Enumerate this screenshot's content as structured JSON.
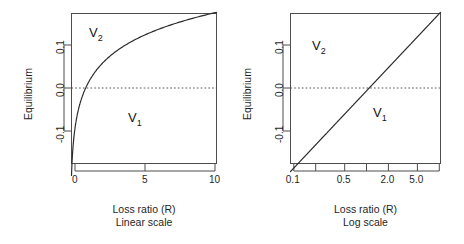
{
  "figure": {
    "background": "#ffffff",
    "line_color": "#2b2b2b",
    "axis_color": "#4d4d4d",
    "zero_line_color": "#555555"
  },
  "panels": [
    {
      "id": "linear",
      "xlabel_line1": "Loss ratio (R)",
      "xlabel_line2": "Linear scale",
      "ylabel": "Equilibrium",
      "region_upper_label": "V",
      "region_upper_sub": "2",
      "region_lower_label": "V",
      "region_lower_sub": "1"
    },
    {
      "id": "log",
      "xlabel_line1": "Loss ratio (R)",
      "xlabel_line2": "Log scale",
      "ylabel": "Equilibrium",
      "region_upper_label": "V",
      "region_upper_sub": "2",
      "region_lower_label": "V",
      "region_lower_sub": "1"
    }
  ],
  "chart_data": [
    {
      "type": "line",
      "id": "linear-scale-panel",
      "title": "",
      "xlabel": "Loss ratio (R) / Linear scale",
      "ylabel": "Equilibrium",
      "xscale": "linear",
      "yscale": "linear",
      "xlim": [
        0.08,
        10.4
      ],
      "ylim": [
        -0.155,
        0.165
      ],
      "xticks": [
        0,
        5,
        10
      ],
      "xticklabels": [
        "0",
        "5",
        "10"
      ],
      "yticks": [
        -0.1,
        0.0,
        0.1
      ],
      "yticklabels": [
        "-0.1",
        "0.0",
        "0.1"
      ],
      "grid": false,
      "legend": "none",
      "annotations": [
        {
          "text": "V2",
          "x": 1.3,
          "y": 0.135
        },
        {
          "text": "V1",
          "x": 4.2,
          "y": -0.065
        }
      ],
      "reference_lines": [
        {
          "orientation": "horizontal",
          "y": 0.0,
          "style": "dotted"
        }
      ],
      "series": [
        {
          "name": "Equilibrium",
          "formula": "y = 0.0715 * ln(R)",
          "x": [
            0.1,
            0.2,
            0.3,
            0.4,
            0.5,
            0.6,
            0.7,
            0.8,
            0.9,
            1.0,
            1.2,
            1.5,
            1.8,
            2.0,
            2.5,
            3.0,
            3.5,
            4.0,
            4.5,
            5.0,
            5.5,
            6.0,
            6.5,
            7.0,
            7.5,
            8.0,
            8.5,
            9.0,
            9.5,
            10.0
          ],
          "y": [
            -0.1646,
            -0.1151,
            -0.0861,
            -0.0655,
            -0.0496,
            -0.0365,
            -0.0255,
            -0.016,
            -0.0075,
            0.0,
            0.013,
            0.029,
            0.042,
            0.0496,
            0.0655,
            0.0786,
            0.0896,
            0.0991,
            0.1076,
            0.1151,
            0.1219,
            0.1281,
            0.1337,
            0.1391,
            0.144,
            0.1487,
            0.1531,
            0.1572,
            0.1611,
            0.1646
          ]
        }
      ]
    },
    {
      "type": "line",
      "id": "log-scale-panel",
      "title": "",
      "xlabel": "Loss ratio (R) / Log scale",
      "ylabel": "Equilibrium",
      "xscale": "log",
      "yscale": "linear",
      "xlim": [
        0.09,
        10.4
      ],
      "ylim": [
        -0.155,
        0.165
      ],
      "xticks": [
        0.1,
        0.2,
        0.5,
        1.0,
        2.0,
        5.0,
        10.0
      ],
      "xticklabels": [
        "0.1",
        "",
        "0.5",
        "",
        "2.0",
        "5.0",
        ""
      ],
      "yticks": [
        -0.1,
        0.0,
        0.1
      ],
      "yticklabels": [
        "-0.1",
        "0.0",
        "0.1"
      ],
      "grid": false,
      "legend": "none",
      "annotations": [
        {
          "text": "V2",
          "x": 0.42,
          "y": 0.105
        },
        {
          "text": "V1",
          "x": 2.6,
          "y": -0.055
        }
      ],
      "reference_lines": [
        {
          "orientation": "horizontal",
          "y": 0.0,
          "style": "dotted"
        }
      ],
      "series": [
        {
          "name": "Equilibrium",
          "formula": "y = 0.0715 * ln(R)",
          "x": [
            0.1,
            0.2,
            0.5,
            1.0,
            2.0,
            5.0,
            10.0
          ],
          "y": [
            -0.1646,
            -0.1151,
            -0.0496,
            0.0,
            0.0496,
            0.1151,
            0.1646
          ]
        }
      ]
    }
  ]
}
